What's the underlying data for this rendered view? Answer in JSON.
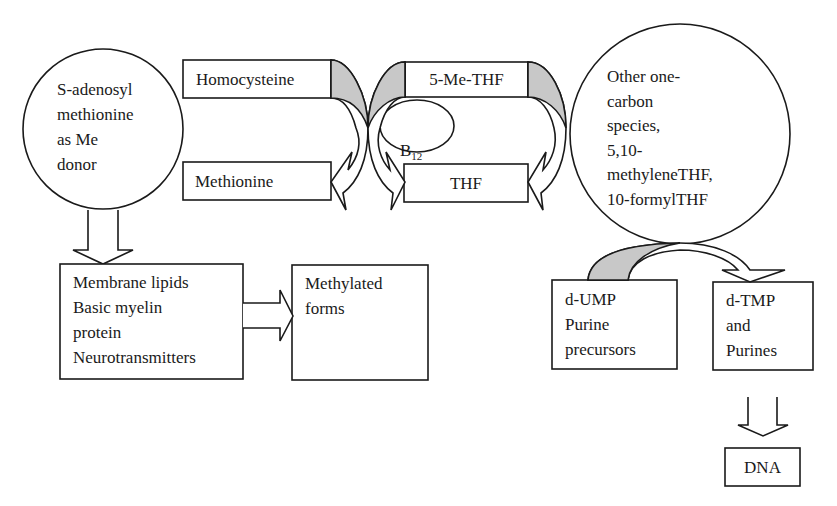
{
  "diagram": {
    "colors": {
      "stroke": "#1a1a1a",
      "fill_shaded": "#c8c8c8",
      "background": "#ffffff"
    },
    "nodes": {
      "sam": {
        "text": "S-adenosyl\nmethionine\nas Me\ndonor",
        "shape": "circle"
      },
      "homocysteine": {
        "text": "Homocysteine",
        "shape": "rect"
      },
      "methionine": {
        "text": "Methionine",
        "shape": "rect"
      },
      "me_thf": {
        "text": "5-Me-THF",
        "shape": "rect"
      },
      "thf": {
        "text": "THF",
        "shape": "rect"
      },
      "b12": {
        "text": "B",
        "sub": "12",
        "shape": "ellipse"
      },
      "other_one_carbon": {
        "text": "Other one-\ncarbon\nspecies,\n5,10-\nmethyleneTHF,\n10-formylTHF",
        "shape": "circle"
      },
      "membrane": {
        "text": "Membrane lipids\nBasic myelin\nprotein\nNeurotransmitters",
        "shape": "rect"
      },
      "methylated": {
        "text": "Methylated\nforms",
        "shape": "rect"
      },
      "dump": {
        "text": "d-UMP\nPurine\nprecursors",
        "shape": "rect"
      },
      "dtmp": {
        "text": "d-TMP\nand\nPurines",
        "shape": "rect"
      },
      "dna": {
        "text": "DNA",
        "shape": "rect"
      }
    },
    "edges": [
      {
        "from": "homocysteine",
        "to": "methionine",
        "style": "curved-block-arrow"
      },
      {
        "from": "me_thf",
        "to": "thf",
        "style": "curved-block-arrow",
        "cofactor": "b12"
      },
      {
        "from": "other_one_carbon",
        "to": "thf",
        "style": "curved-block-arrow"
      },
      {
        "from": "sam",
        "to": "membrane",
        "style": "block-arrow-down"
      },
      {
        "from": "membrane",
        "to": "methylated",
        "style": "block-arrow-right"
      },
      {
        "from": "dump",
        "to": "dtmp",
        "style": "curved-block-arrow"
      },
      {
        "from": "dtmp",
        "to": "dna",
        "style": "block-arrow-down"
      }
    ]
  }
}
